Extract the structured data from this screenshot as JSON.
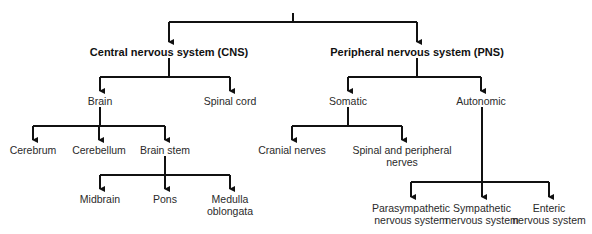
{
  "diagram": {
    "type": "hierarchy-tree",
    "title": "Nervous system",
    "colors": {
      "line": "#111111",
      "text": "#2a2a2a",
      "background": "#ffffff"
    },
    "nodes": {
      "cns": {
        "label": "Central nervous system (CNS)"
      },
      "pns": {
        "label": "Peripheral nervous system (PNS)"
      },
      "brain": {
        "label": "Brain"
      },
      "spinal_cord": {
        "label": "Spinal cord"
      },
      "somatic": {
        "label": "Somatic"
      },
      "autonomic": {
        "label": "Autonomic"
      },
      "cerebrum": {
        "label": "Cerebrum"
      },
      "cerebellum": {
        "label": "Cerebellum"
      },
      "brain_stem": {
        "label": "Brain stem"
      },
      "cranial_nerves": {
        "label": "Cranial nerves"
      },
      "spinal_peripheral": {
        "line1": "Spinal and peripheral",
        "line2": "nerves"
      },
      "midbrain": {
        "label": "Midbrain"
      },
      "pons": {
        "label": "Pons"
      },
      "medulla": {
        "line1": "Medulla",
        "line2": "oblongata"
      },
      "parasympathetic": {
        "line1": "Parasympathetic",
        "line2": "nervous system"
      },
      "sympathetic": {
        "line1": "Sympathetic",
        "line2": "nervous system"
      },
      "enteric": {
        "line1": "Enteric",
        "line2": "nervous system"
      }
    },
    "edges": [
      [
        "root",
        "cns"
      ],
      [
        "root",
        "pns"
      ],
      [
        "cns",
        "brain"
      ],
      [
        "cns",
        "spinal_cord"
      ],
      [
        "pns",
        "somatic"
      ],
      [
        "pns",
        "autonomic"
      ],
      [
        "brain",
        "cerebrum"
      ],
      [
        "brain",
        "cerebellum"
      ],
      [
        "brain",
        "brain_stem"
      ],
      [
        "brain_stem",
        "midbrain"
      ],
      [
        "brain_stem",
        "pons"
      ],
      [
        "brain_stem",
        "medulla"
      ],
      [
        "somatic",
        "cranial_nerves"
      ],
      [
        "somatic",
        "spinal_peripheral"
      ],
      [
        "autonomic",
        "parasympathetic"
      ],
      [
        "autonomic",
        "sympathetic"
      ],
      [
        "autonomic",
        "enteric"
      ]
    ]
  }
}
